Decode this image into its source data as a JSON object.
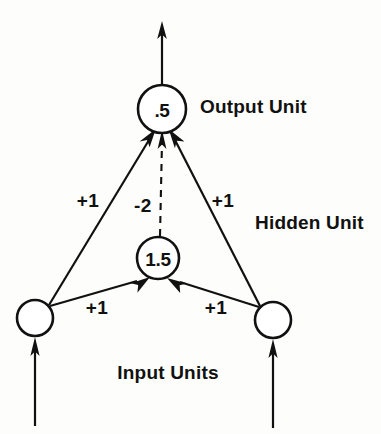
{
  "diagram": {
    "type": "neural-network",
    "title": "",
    "background_color": "#fdfdfc",
    "ink_color": "#111111",
    "layers": [
      {
        "id": "output",
        "label": "Output Unit",
        "label_x": 200,
        "label_y": 106,
        "units": [
          {
            "id": "output-unit",
            "value": ".5",
            "cx": 162,
            "cy": 109,
            "r": 24
          }
        ]
      },
      {
        "id": "hidden",
        "label": "Hidden Unit",
        "label_x": 255,
        "label_y": 222,
        "units": [
          {
            "id": "hidden-unit",
            "value": "1.5",
            "cx": 158,
            "cy": 258,
            "r": 21
          }
        ]
      },
      {
        "id": "input",
        "label": "Input Units",
        "label_x": 168,
        "label_y": 372,
        "units": [
          {
            "id": "input-unit-left",
            "value": "",
            "cx": 35,
            "cy": 318,
            "r": 18
          },
          {
            "id": "input-unit-right",
            "value": "",
            "cx": 273,
            "cy": 320,
            "r": 18
          }
        ]
      }
    ],
    "edges": [
      {
        "id": "edge-input-left-to-output",
        "from": "input-unit-left",
        "to": "output-unit",
        "weight": "+1",
        "style": "solid",
        "label_x": 88,
        "label_y": 200,
        "x1": 49,
        "y1": 305,
        "x2": 152,
        "y2": 135
      },
      {
        "id": "edge-input-right-to-output",
        "from": "input-unit-right",
        "to": "output-unit",
        "weight": "+1",
        "style": "solid",
        "label_x": 223,
        "label_y": 200,
        "x1": 260,
        "y1": 306,
        "x2": 173,
        "y2": 135
      },
      {
        "id": "edge-hidden-to-output",
        "from": "hidden-unit",
        "to": "output-unit",
        "weight": "-2",
        "style": "dashed",
        "label_x": 143,
        "label_y": 205,
        "x1": 160,
        "y1": 236,
        "x2": 162,
        "y2": 137
      },
      {
        "id": "edge-input-left-to-hidden",
        "from": "input-unit-left",
        "to": "hidden-unit",
        "weight": "+1",
        "style": "solid",
        "label_x": 97,
        "label_y": 307,
        "x1": 50,
        "y1": 306,
        "x2": 149,
        "y2": 278
      },
      {
        "id": "edge-input-right-to-hidden",
        "from": "input-unit-right",
        "to": "hidden-unit",
        "weight": "+1",
        "style": "solid",
        "label_x": 216,
        "label_y": 307,
        "x1": 259,
        "y1": 307,
        "x2": 168,
        "y2": 278
      }
    ],
    "external_arrows": [
      {
        "id": "output-arrow",
        "direction": "up",
        "description": "network output arrow leaving output unit",
        "x": 162,
        "y_from": 85,
        "y_to": 22
      },
      {
        "id": "input-arrow-left",
        "direction": "up",
        "description": "external input arrow entering left input unit",
        "x": 35,
        "y_from": 425,
        "y_to": 338
      },
      {
        "id": "input-arrow-right",
        "direction": "up",
        "description": "external input arrow entering right input unit",
        "x": 273,
        "y_from": 427,
        "y_to": 340
      }
    ]
  }
}
